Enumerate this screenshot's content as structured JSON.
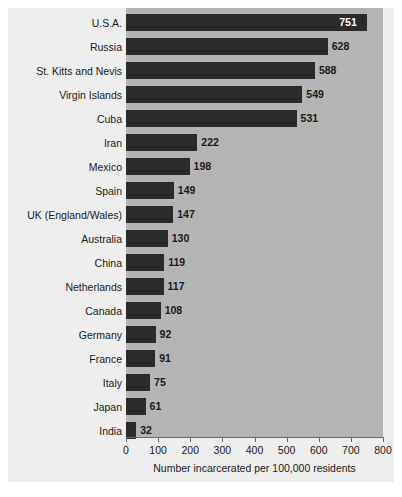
{
  "chart_data": {
    "type": "bar",
    "orientation": "horizontal",
    "title": "",
    "subtitle": "",
    "xlabel": "Number incarcerated per 100,000 residents",
    "ylabel": "",
    "xlim": [
      0,
      800
    ],
    "xticks": [
      0,
      100,
      200,
      300,
      400,
      500,
      600,
      700,
      800
    ],
    "xtick_labels": [
      "0",
      "100",
      "200",
      "300",
      "400",
      "500",
      "600",
      "700",
      "800"
    ],
    "grid": false,
    "legend": null,
    "categories": [
      "U.S.A.",
      "Russia",
      "St. Kitts and Nevis",
      "Virgin Islands",
      "Cuba",
      "Iran",
      "Mexico",
      "Spain",
      "UK (England/Wales)",
      "Australia",
      "China",
      "Netherlands",
      "Canada",
      "Germany",
      "France",
      "Italy",
      "Japan",
      "India"
    ],
    "values": [
      751,
      628,
      588,
      549,
      531,
      222,
      198,
      149,
      147,
      130,
      119,
      117,
      108,
      92,
      91,
      75,
      61,
      32
    ],
    "value_labels": [
      "751",
      "628",
      "588",
      "549",
      "531",
      "222",
      "198",
      "149",
      "147",
      "130",
      "119",
      "117",
      "108",
      "92",
      "91",
      "75",
      "61",
      "32"
    ],
    "label_placement": [
      "inside",
      "outside",
      "outside",
      "outside",
      "outside",
      "outside",
      "outside",
      "outside",
      "outside",
      "outside",
      "outside",
      "outside",
      "outside",
      "outside",
      "outside",
      "outside",
      "outside",
      "outside"
    ],
    "colors": {
      "bar": "#2b2b2b",
      "plot_background": "#b4b4b4",
      "figure_background": "#eeeeee",
      "page_background": "#ffffff",
      "text": "#1a1a1a",
      "inside_label": "#ffffff",
      "axis": "#6a6a6a"
    }
  }
}
